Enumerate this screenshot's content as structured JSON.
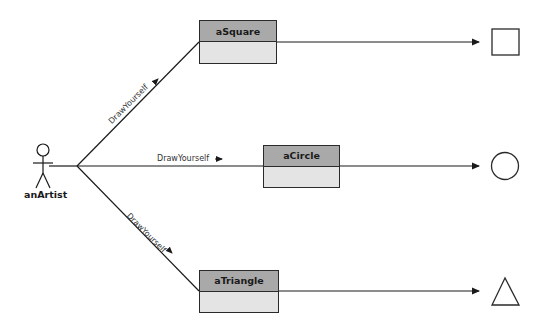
{
  "diagram": {
    "type": "interaction-diagram",
    "actor": {
      "label": "anArtist"
    },
    "objects": [
      {
        "id": "square",
        "label": "aSquare",
        "result_shape": "square"
      },
      {
        "id": "circle",
        "label": "aCircle",
        "result_shape": "circle"
      },
      {
        "id": "triangle",
        "label": "aTriangle",
        "result_shape": "triangle"
      }
    ],
    "messages": [
      {
        "to": "aSquare",
        "label": "DrawYourself",
        "arrow": "→"
      },
      {
        "to": "aCircle",
        "label": "DrawYourself",
        "arrow": "→"
      },
      {
        "to": "aTriangle",
        "label": "DrawYourself",
        "arrow": "→"
      }
    ],
    "colors": {
      "object_header": "#a9a9a9",
      "object_body": "#e4e4e4",
      "line": "#1a1a1a"
    }
  }
}
